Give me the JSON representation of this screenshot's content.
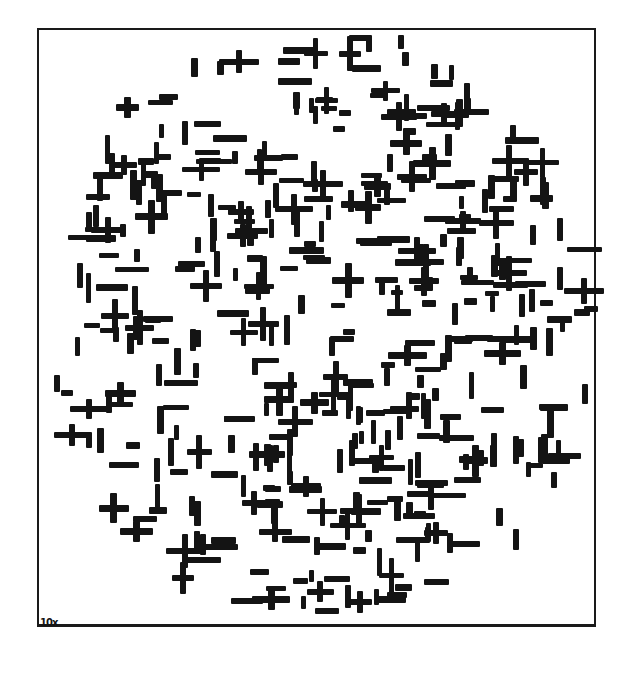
{
  "artwork": {
    "description": "Abstract composition of black horizontal and vertical bars and plus signs within an oval field on white ground",
    "signature": "10x",
    "frame": {
      "x": 37,
      "y": 28,
      "w": 559,
      "h": 599
    },
    "ink_color": "#141414",
    "paper_color": "#ffffff",
    "field": {
      "cx": 318,
      "cy": 320,
      "rx": 272,
      "ry": 300
    },
    "seed": 7,
    "mark_count": 430
  }
}
